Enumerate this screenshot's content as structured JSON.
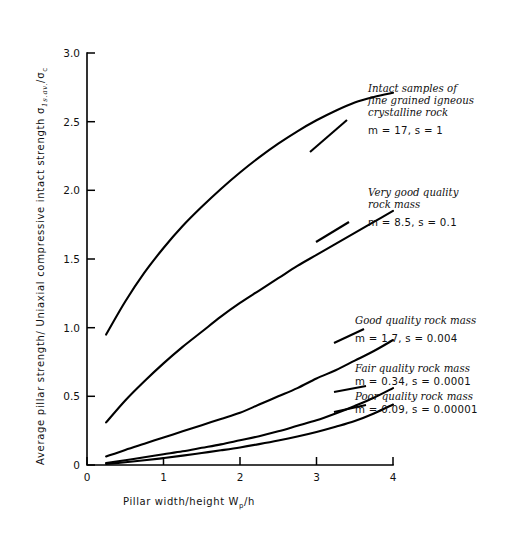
{
  "chart_data": {
    "type": "line",
    "title": "",
    "xlabel": "Pillar width/height  Wp/h",
    "ylabel": "Average pillar strength/ Uniaxial compressive intact strength  σ1s.av./σc",
    "xlim": [
      0,
      4
    ],
    "ylim": [
      0,
      3.0
    ],
    "xticks": [
      0,
      1,
      2,
      3,
      4
    ],
    "xticklabels": [
      "0",
      "1",
      "2",
      "3",
      "4"
    ],
    "yticks": [
      0,
      0.5,
      1.0,
      1.5,
      2.0,
      2.5,
      3.0
    ],
    "yticklabels": [
      "0",
      "0.5",
      "1.0",
      "1.5",
      "2.0",
      "2.5",
      "3.0"
    ],
    "grid": false,
    "legend_position": "inline-annotations",
    "x": [
      0.25,
      0.5,
      0.75,
      1.0,
      1.25,
      1.5,
      1.75,
      2.0,
      2.25,
      2.5,
      2.75,
      3.0,
      3.25,
      3.5,
      3.75,
      4.0
    ],
    "series": [
      {
        "name": "Intact samples of fine grained igneous crystalline rock",
        "m": 17,
        "s": 1,
        "values": [
          0.95,
          1.19,
          1.4,
          1.58,
          1.74,
          1.88,
          2.01,
          2.13,
          2.24,
          2.34,
          2.43,
          2.51,
          2.58,
          2.64,
          2.68,
          2.71
        ]
      },
      {
        "name": "Very good quality rock mass",
        "m": 8.5,
        "s": 0.1,
        "values": [
          0.31,
          0.47,
          0.61,
          0.74,
          0.86,
          0.97,
          1.08,
          1.18,
          1.27,
          1.36,
          1.45,
          1.53,
          1.61,
          1.69,
          1.77,
          1.85
        ]
      },
      {
        "name": "Good quality rock mass",
        "m": 1.7,
        "s": 0.004,
        "values": [
          0.062,
          0.11,
          0.155,
          0.2,
          0.245,
          0.29,
          0.335,
          0.38,
          0.44,
          0.5,
          0.56,
          0.63,
          0.69,
          0.76,
          0.83,
          0.91
        ]
      },
      {
        "name": "Fair quality rock mass",
        "m": 0.34,
        "s": 0.0001,
        "values": [
          0.015,
          0.035,
          0.056,
          0.078,
          0.1,
          0.125,
          0.15,
          0.18,
          0.21,
          0.245,
          0.285,
          0.325,
          0.375,
          0.43,
          0.49,
          0.56
        ]
      },
      {
        "name": "Poor quality rock mass",
        "m": 0.09,
        "s": 1e-05,
        "values": [
          0.008,
          0.02,
          0.034,
          0.05,
          0.068,
          0.087,
          0.107,
          0.128,
          0.152,
          0.178,
          0.207,
          0.24,
          0.278,
          0.32,
          0.375,
          0.44
        ]
      }
    ],
    "annotations": [
      {
        "id": "intact",
        "lines": [
          "Intact samples of",
          "fine grained igneous",
          "crystalline rock"
        ],
        "params": "m = 17, s = 1"
      },
      {
        "id": "very-good",
        "lines": [
          "Very good quality",
          "rock mass"
        ],
        "params": "m = 8.5, s = 0.1"
      },
      {
        "id": "good",
        "lines": [
          "Good quality rock mass"
        ],
        "params": "m = 1.7, s = 0.004"
      },
      {
        "id": "fair",
        "lines": [
          "Fair quality rock mass"
        ],
        "params": "m = 0.34, s = 0.0001"
      },
      {
        "id": "poor",
        "lines": [
          "Poor quality rock mass"
        ],
        "params": "m = 0.09, s = 0.00001"
      }
    ]
  },
  "axes": {
    "y_label_prefix": "Average pillar strength/ Uniaxial compressive intact strength",
    "y_label_symbol_sigma": "σ",
    "y_label_symbol_sub1": "1s.av.",
    "y_label_symbol_slash": "/",
    "y_label_symbol_sub2": "c",
    "x_label_prefix": "Pillar width/height",
    "x_label_symbol_w": "W",
    "x_label_symbol_wsub": "p",
    "x_label_symbol_h": "/h"
  },
  "colors": {
    "curve": "#000000",
    "axis": "#000000",
    "text": "#111111",
    "background": "#ffffff"
  }
}
